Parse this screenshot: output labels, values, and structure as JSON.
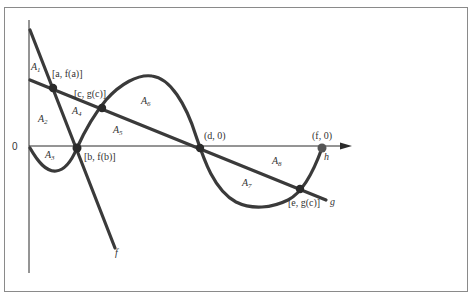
{
  "diagram": {
    "origin_label": "0",
    "curves": {
      "f": {
        "label": "f"
      },
      "g": {
        "label": "g"
      },
      "h": {
        "label": "h"
      }
    },
    "points": {
      "a": {
        "label": "[a, f(a)]"
      },
      "c": {
        "label": "[c, g(c)]"
      },
      "b": {
        "label": "[b, f(b)]"
      },
      "d": {
        "label": "(d, 0)"
      },
      "f": {
        "label": "(f, 0)"
      },
      "e": {
        "label": "[e, g(c)]"
      }
    },
    "regions": {
      "A1": "A",
      "A1_sub": "1",
      "A2": "A",
      "A2_sub": "2",
      "A3": "A",
      "A3_sub": "3",
      "A4": "A",
      "A4_sub": "4",
      "A5": "A",
      "A5_sub": "5",
      "A6": "A",
      "A6_sub": "6",
      "A7": "A",
      "A7_sub": "7",
      "A8": "A",
      "A8_sub": "8"
    },
    "colors": {
      "curve": "#3a3a3a",
      "axis": "#2a2a2a",
      "frame": "#8a8a8a"
    }
  }
}
